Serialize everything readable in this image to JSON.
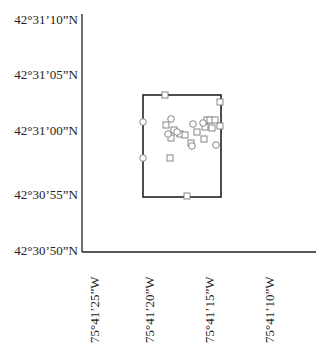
{
  "map": {
    "y_axis": {
      "labels": [
        "42°31’10”N",
        "42°31’05”N",
        "42°31’00”N",
        "42°30’55”N",
        "42°30’50”N"
      ],
      "pixel_y": [
        20,
        75,
        131,
        195,
        251
      ]
    },
    "x_axis": {
      "labels": [
        "75°41’25”W",
        "75°41’20”W",
        "75°41’15”W",
        "75°41’10”W"
      ],
      "pixel_x": [
        95,
        150,
        210,
        270
      ]
    },
    "study_area": {
      "x": 143,
      "y": 95,
      "width": 78,
      "height": 102
    },
    "colors": {
      "axis": "#222222",
      "marker": "#7a7a7a",
      "text": "#222222"
    }
  },
  "chart_data": {
    "type": "scatter",
    "title": "",
    "xlabel": "Longitude",
    "ylabel": "Latitude",
    "x_ticks": [
      "75°41’25”W",
      "75°41’20”W",
      "75°41’15”W",
      "75°41’10”W"
    ],
    "y_ticks": [
      "42°30’50”N",
      "42°30’55”N",
      "42°31’00”N",
      "42°31’05”N",
      "42°31’10”N"
    ],
    "grid": false,
    "legend": null,
    "annotations": [
      "Rectangular study-area boundary"
    ],
    "series": [
      {
        "name": "squares",
        "marker": "square",
        "points_px": [
          [
            165,
            95
          ],
          [
            220,
            102
          ],
          [
            166,
            125
          ],
          [
            174,
            130
          ],
          [
            171,
            138
          ],
          [
            180,
            134
          ],
          [
            185,
            135
          ],
          [
            197,
            132
          ],
          [
            205,
            127
          ],
          [
            207,
            120
          ],
          [
            212,
            128
          ],
          [
            210,
            120
          ],
          [
            215,
            120
          ],
          [
            220,
            126
          ],
          [
            204,
            139
          ],
          [
            191,
            143
          ],
          [
            170,
            158
          ],
          [
            187,
            196
          ]
        ]
      },
      {
        "name": "circles",
        "marker": "circle",
        "points_px": [
          [
            143,
            122
          ],
          [
            143,
            158
          ],
          [
            171,
            119
          ],
          [
            168,
            134
          ],
          [
            177,
            132
          ],
          [
            193,
            124
          ],
          [
            203,
            123
          ],
          [
            192,
            146
          ],
          [
            216,
            145
          ]
        ]
      }
    ]
  }
}
